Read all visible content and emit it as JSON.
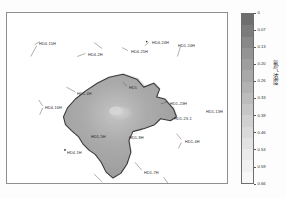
{
  "figure": {
    "background_color": "#fdfdfd",
    "frame_color": "#8f8f8f"
  },
  "chart_data": {
    "type": "heatmap",
    "title": "",
    "xlabel": "",
    "ylabel": "",
    "colorbar": {
      "label": "氡气浓度",
      "orientation": "vertical",
      "vmin": 0,
      "vmax": 0.66,
      "tick_labels": [
        "0",
        "0.07",
        "0.13",
        "0.20",
        "0.26",
        "0.33",
        "0.39",
        "0.46",
        "0.53",
        "0.59",
        "0.66"
      ],
      "tick_values": [
        0,
        0.07,
        0.13,
        0.2,
        0.26,
        0.33,
        0.39,
        0.46,
        0.53,
        0.59,
        0.66
      ],
      "colors": [
        "#6e6e6e",
        "#7b7b7b",
        "#888888",
        "#949494",
        "#9e9e9e",
        "#a8a8a8",
        "#b2b2b2",
        "#bcbcbc",
        "#c6c6c6",
        "#d0d0d0",
        "#d9d9d9",
        "#e2e2e2",
        "#eaeaea",
        "#f1f1f1",
        "#f8f8f8"
      ]
    },
    "region": {
      "name": "island-outline",
      "fill_color": "#a6a6a6",
      "edge_color": "#3a3a3a",
      "interior_highlight_color": "#c9c9c9"
    },
    "annotations": [
      {
        "id": "w1",
        "label": "HD4-15H",
        "x": 32,
        "y": 29,
        "on_land": false
      },
      {
        "id": "w2",
        "label": "HD4-2H",
        "x": 81,
        "y": 40,
        "on_land": false
      },
      {
        "id": "w3",
        "label": "HD4-25H",
        "x": 124,
        "y": 37,
        "on_land": false
      },
      {
        "id": "w4",
        "label": "HD4-24H",
        "x": 145,
        "y": 28,
        "on_land": false
      },
      {
        "id": "w5",
        "label": "HD1-24H",
        "x": 171,
        "y": 31,
        "on_land": false
      },
      {
        "id": "w6",
        "label": "HD1-4H",
        "x": 70,
        "y": 79,
        "on_land": false
      },
      {
        "id": "w7",
        "label": "HD4-16H",
        "x": 38,
        "y": 93,
        "on_land": false
      },
      {
        "id": "w8",
        "label": "HD1",
        "x": 122,
        "y": 73,
        "on_land": false
      },
      {
        "id": "w9",
        "label": "HD1-23H",
        "x": 163,
        "y": 89,
        "on_land": false
      },
      {
        "id": "w10",
        "label": "HD1-23-1",
        "x": 167,
        "y": 104,
        "on_land": false
      },
      {
        "id": "w11",
        "label": "HD1-13H",
        "x": 199,
        "y": 97,
        "on_land": false
      },
      {
        "id": "w12",
        "label": "HD1-5H",
        "x": 84,
        "y": 122,
        "on_land": true
      },
      {
        "id": "w13",
        "label": "HD1-8H",
        "x": 122,
        "y": 123,
        "on_land": true
      },
      {
        "id": "w14",
        "label": "HD1-4H",
        "x": 178,
        "y": 127,
        "on_land": false
      },
      {
        "id": "w15",
        "label": "HD4-1H",
        "x": 60,
        "y": 138,
        "on_land": false
      },
      {
        "id": "w16",
        "label": "HD1-7H",
        "x": 137,
        "y": 158,
        "on_land": false
      },
      {
        "id": "w17",
        "label": "HD4-24H",
        "x": 98,
        "y": 170,
        "on_land": false
      },
      {
        "id": "w18",
        "label": "HD1-9H",
        "x": 166,
        "y": 175,
        "on_land": false
      }
    ]
  }
}
